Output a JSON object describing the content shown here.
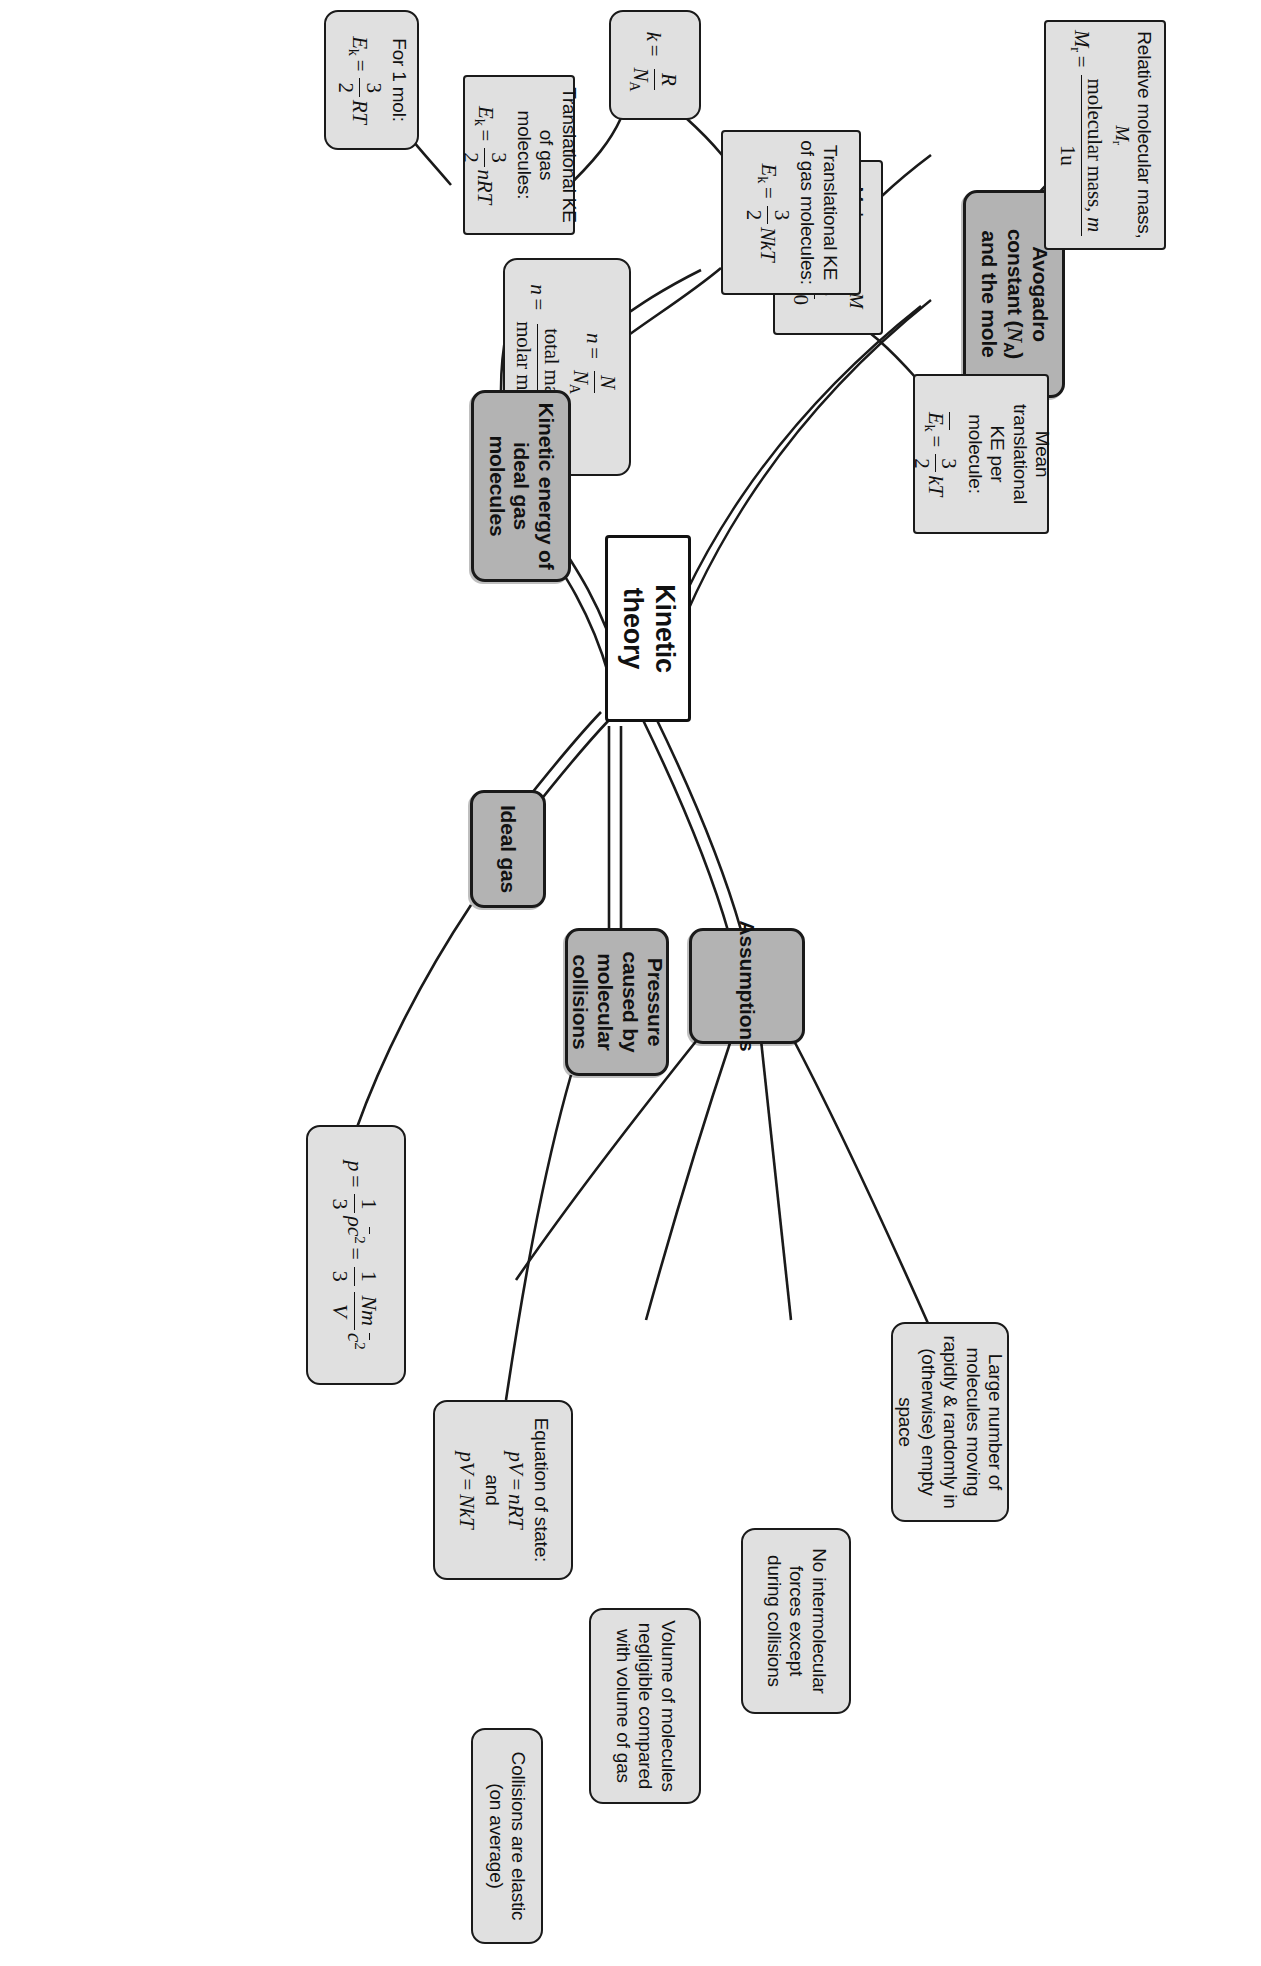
{
  "diagram": {
    "type": "mind-map",
    "title": "Kinetic theory",
    "orientation": "rotated-90-clockwise",
    "colors": {
      "central_fill": "#ffffff",
      "branch_fill": "#b3b3b3",
      "leaf_fill": "#e0e0e0",
      "stroke": "#1a1a1a"
    }
  },
  "central": {
    "label": "Kinetic theory"
  },
  "branches": [
    {
      "id": "avogadro",
      "label": "Avogadro constant (Nₐ) and the mole"
    },
    {
      "id": "ke",
      "label": "Kinetic energy of ideal gas molecules"
    },
    {
      "id": "ideal_gas",
      "label": "Ideal gas"
    },
    {
      "id": "pressure",
      "label": "Pressure caused by molecular collisions"
    },
    {
      "id": "assumptions",
      "label": "Assumptions"
    }
  ],
  "nodes": {
    "relative_molecular_mass": {
      "title": "Relative molecular mass, Mᵣ",
      "eq_lhs": "Mᵣ =",
      "eq_num": "molecular mass, m",
      "eq_den": "1u"
    },
    "molar_mass": {
      "title": "Molar mass, M",
      "eq_lhs": "M / kg =",
      "eq_num": "Mᵣ",
      "eq_den": "1000"
    },
    "amount_of_substance": {
      "eq1_lhs": "n =",
      "eq1_num": "N",
      "eq1_den": "Nₐ",
      "eq2_lhs": "n =",
      "eq2_num": "total mass, m",
      "eq2_den": "molar mass, M"
    },
    "translational_ke_nrt": {
      "title": "Translational KE of gas molecules:",
      "eq_lhs": "Eₖ =",
      "eq_num": "3",
      "eq_den": "2",
      "eq_rhs": "nRT"
    },
    "for_one_mol": {
      "title": "For 1 mol:",
      "eq_lhs": "Eₖ =",
      "eq_num": "3",
      "eq_den": "2",
      "eq_rhs": "RT"
    },
    "boltzmann": {
      "eq_lhs": "k =",
      "eq_num": "R",
      "eq_den": "Nₐ"
    },
    "translational_ke_nkt": {
      "title": "Translational KE of gas molecules:",
      "eq_lhs": "Eₖ =",
      "eq_num": "3",
      "eq_den": "2",
      "eq_rhs": "NkT"
    },
    "mean_translational_ke": {
      "title": "Mean translational KE per molecule:",
      "eq_lhs": "Eₖ =",
      "eq_num": "3",
      "eq_den": "2",
      "eq_rhs": "kT"
    },
    "pressure_equation": {
      "eq_lhs": "p =",
      "f1_num": "1",
      "f1_den": "3",
      "mid1": "ρc̄² =",
      "f2_num": "1",
      "f2_den": "3",
      "f3_num": "Nm",
      "f3_den": "V",
      "tail": "c̄²"
    },
    "equation_of_state": {
      "title": "Equation of state:",
      "eq1": "pV = nRT",
      "and": "and",
      "eq2": "pV = NkT"
    },
    "assumption_large_number": {
      "text": "Large number of molecules moving rapidly & randomly in (otherwise) empty space"
    },
    "assumption_no_forces": {
      "text": "No intermolecular forces except during collisions"
    },
    "assumption_volume": {
      "text": "Volume of molecules negligible compared with volume of gas"
    },
    "assumption_elastic": {
      "text": "Collisions are elastic (on average)"
    }
  }
}
